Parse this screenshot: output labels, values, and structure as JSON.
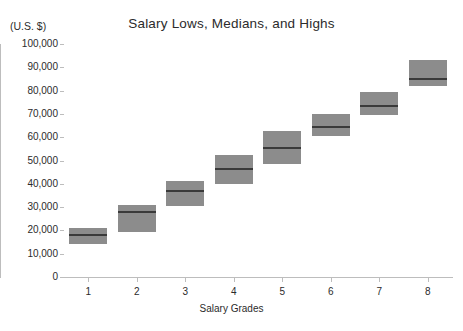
{
  "chart_data": {
    "type": "bar",
    "title": "Salary Lows, Medians, and Highs",
    "xlabel": "Salary Grades",
    "ylabel": "(U.S. $)",
    "grid": false,
    "legend": "none",
    "ylim": [
      0,
      100000
    ],
    "ytick_labels": [
      "100,000",
      "90,000",
      "80,000",
      "70,000",
      "60,000",
      "50,000",
      "40,000",
      "30,000",
      "20,000",
      "10,000",
      "0"
    ],
    "ytick_values": [
      100000,
      90000,
      80000,
      70000,
      60000,
      50000,
      40000,
      30000,
      20000,
      10000,
      0
    ],
    "categories": [
      "1",
      "2",
      "3",
      "4",
      "5",
      "6",
      "7",
      "8"
    ],
    "series": [
      {
        "name": "Low",
        "values": [
          14000,
          19500,
          30500,
          40000,
          48500,
          60500,
          69500,
          82000
        ]
      },
      {
        "name": "Median",
        "values": [
          18000,
          28000,
          37000,
          46500,
          55500,
          64500,
          73500,
          85000
        ]
      },
      {
        "name": "High",
        "values": [
          21000,
          31000,
          41000,
          52500,
          62500,
          70000,
          79500,
          93000
        ]
      }
    ],
    "boxes": [
      {
        "grade": "1",
        "low": 14000,
        "median": 18000,
        "high": 21000
      },
      {
        "grade": "2",
        "low": 19500,
        "median": 28000,
        "high": 31000
      },
      {
        "grade": "3",
        "low": 30500,
        "median": 37000,
        "high": 41000
      },
      {
        "grade": "4",
        "low": 40000,
        "median": 46500,
        "high": 52500
      },
      {
        "grade": "5",
        "low": 48500,
        "median": 55500,
        "high": 62500
      },
      {
        "grade": "6",
        "low": 60500,
        "median": 64500,
        "high": 70000
      },
      {
        "grade": "7",
        "low": 69500,
        "median": 73500,
        "high": 79500
      },
      {
        "grade": "8",
        "low": 82000,
        "median": 85000,
        "high": 93000
      }
    ],
    "colors": {
      "box_fill": "#8c8c8c",
      "median_line": "#3a3a3a",
      "axis": "#bdbdbd",
      "text": "#2b2b2b",
      "background": "#ffffff"
    }
  }
}
